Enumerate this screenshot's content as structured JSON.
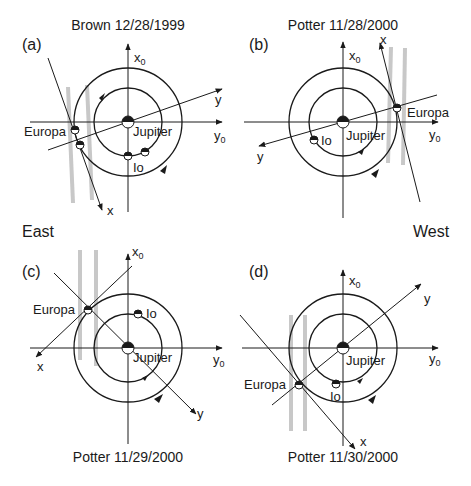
{
  "figure": {
    "side_labels": {
      "east": "East",
      "west": "West"
    },
    "panels": [
      {
        "id": "a",
        "label": "(a)",
        "caption": "Brown 12/28/1999",
        "caption_position": "top",
        "axes": {
          "x0": "x",
          "x0_sub": "0",
          "y0": "y",
          "y0_sub": "0",
          "x": "x",
          "y": "y"
        },
        "bodies": {
          "jupiter": "Jupiter",
          "europa": "Europa",
          "io": "Io"
        }
      },
      {
        "id": "b",
        "label": "(b)",
        "caption": "Potter 11/28/2000",
        "caption_position": "top",
        "axes": {
          "x0": "x",
          "x0_sub": "0",
          "y0": "y",
          "y0_sub": "0",
          "x": "x",
          "y": "y"
        },
        "bodies": {
          "jupiter": "Jupiter",
          "europa": "Europa",
          "io": "Io"
        }
      },
      {
        "id": "c",
        "label": "(c)",
        "caption": "Potter 11/29/2000",
        "caption_position": "bottom",
        "axes": {
          "x0": "x",
          "x0_sub": "0",
          "y0": "y",
          "y0_sub": "0",
          "x": "x",
          "y": "y"
        },
        "bodies": {
          "jupiter": "Jupiter",
          "europa": "Europa",
          "io": "Io"
        }
      },
      {
        "id": "d",
        "label": "(d)",
        "caption": "Potter 11/30/2000",
        "caption_position": "bottom",
        "axes": {
          "x0": "x",
          "x0_sub": "0",
          "y0": "y",
          "y0_sub": "0",
          "x": "x",
          "y": "y"
        },
        "bodies": {
          "jupiter": "Jupiter",
          "europa": "Europa",
          "io": "Io"
        }
      }
    ],
    "colors": {
      "line": "#1a1a1a",
      "slit": "#c8c8c8",
      "background": "#ffffff"
    }
  }
}
